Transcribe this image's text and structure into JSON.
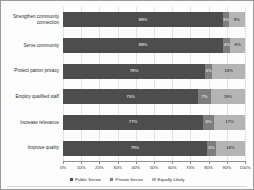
{
  "chart_data": {
    "type": "bar",
    "subtype": "stacked-horizontal-100pct",
    "title": "",
    "xlabel": "",
    "ylabel": "",
    "xlim": [
      0,
      100
    ],
    "xticks": [
      "0%",
      "10%",
      "20%",
      "30%",
      "40%",
      "50%",
      "60%",
      "70%",
      "80%",
      "90%",
      "100%"
    ],
    "grid": true,
    "legend_position": "bottom",
    "categories": [
      "Strengthen community\nconnection",
      "Serve community",
      "Protect patron privacy",
      "Employ qualified staff",
      "Increase relevance",
      "Improve quality"
    ],
    "series": [
      {
        "name": "Public Sector",
        "color": "#4d4d4d",
        "values": [
          88,
          88,
          78,
          75,
          77,
          79
        ],
        "labels": [
          "88%",
          "88%",
          "78%",
          "75%",
          "77%",
          "79%"
        ]
      },
      {
        "name": "Private Sector",
        "color": "#7d7d7d",
        "values": [
          3,
          4,
          4,
          7,
          6,
          5
        ],
        "labels": [
          "3%",
          "4%",
          "4%",
          "7%",
          "6%",
          "5%"
        ]
      },
      {
        "name": "Equally Likely",
        "color": "#b4b4b4",
        "values": [
          9,
          8,
          18,
          19,
          17,
          16
        ],
        "labels": [
          "9%",
          "8%",
          "18%",
          "19%",
          "17%",
          "16%"
        ]
      }
    ]
  }
}
